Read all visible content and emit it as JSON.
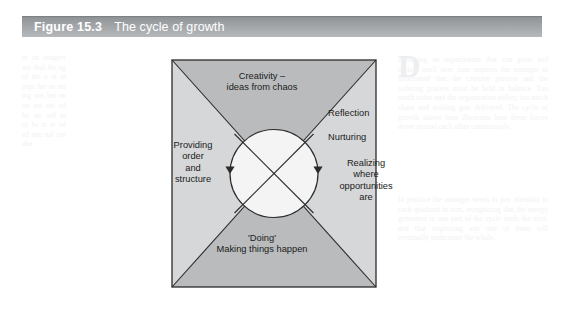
{
  "caption": {
    "number": "Figure 15.3",
    "title": "The cycle of growth",
    "bar_color": "#a6a9ac",
    "text_color": "#ffffff"
  },
  "diagram": {
    "type": "cycle-of-growth-quadrant",
    "shape": "square-with-diagonals-and-inscribed-circle",
    "colors": {
      "dark_fill": "#b9bbbd",
      "light_fill": "#d6d7d8",
      "circle_fill": "#f4f4f4",
      "line": "#2b2b2b"
    },
    "quadrants": {
      "top": "Creativity –\nideas from chaos",
      "right_line_1": "Reflection",
      "right_line_2": "Nurturing",
      "right_line_3": "Realizing\nwhere\nopportunities\nare",
      "bottom": "'Doing'\nMaking things happen",
      "left": "Providing\norder\nand\nstructure"
    },
    "arrows": [
      {
        "name": "left-arrow-down",
        "direction": "down"
      },
      {
        "name": "right-arrow-down",
        "direction": "down"
      }
    ]
  },
  "page_showthrough": {
    "dropcap": "D",
    "left_column": "er on anagers wo deal the ng of the e at in arge her as rm ing ous her an on ent ow ed he ate ted nt of he ts er ad ed one nal ion ake",
    "right_column": "eveloping an organization that can grow and sustain itself over time requires the manager to understand that the creative process and the ordering process must be held in balance. Too much order and the organization stifles; too much chaos and nothing gets delivered. The cycle of growth shown here illustrates how these forces move around each other continuously.",
    "bottom_column": "In practice the manager needs to pay attention to each quadrant in turn, recognizing that the energy generated in one part of the cycle feeds the next, and that neglecting any one of them will eventually undermine the whole."
  }
}
